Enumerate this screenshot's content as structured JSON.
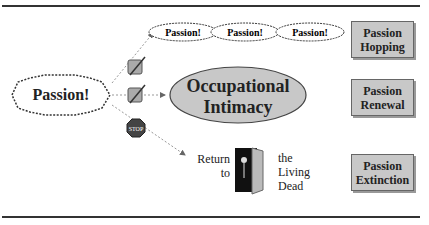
{
  "diagram": {
    "start_node": {
      "label": "Passion!"
    },
    "top_chain": [
      {
        "label": "Passion!"
      },
      {
        "label": "Passion!"
      },
      {
        "label": "Passion!"
      }
    ],
    "center_node": {
      "line1": "Occupational",
      "line2": "Intimacy"
    },
    "stop_sign": {
      "label": "STOP"
    },
    "dead_path": {
      "return_line1": "Return",
      "return_line2": "to",
      "dead_line1": "the",
      "dead_line2": "Living",
      "dead_line3": "Dead"
    },
    "outcomes": [
      {
        "line1": "Passion",
        "line2": "Hopping"
      },
      {
        "line1": "Passion",
        "line2": "Renewal"
      },
      {
        "line1": "Passion",
        "line2": "Extinction"
      }
    ]
  }
}
